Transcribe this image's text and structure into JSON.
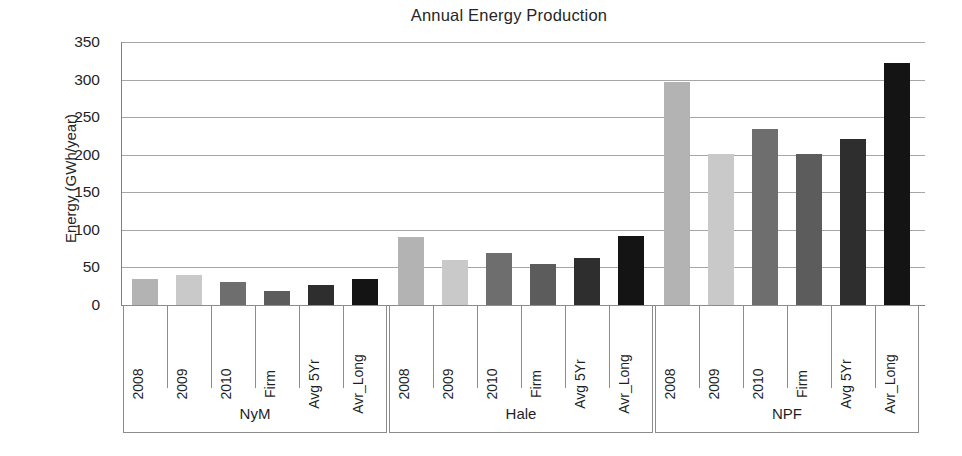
{
  "chart_data": {
    "type": "bar",
    "title": "Annual Energy Production",
    "xlabel": "",
    "ylabel": "Energy (GWh/year)",
    "ylim": [
      0,
      350
    ],
    "ytick_step": 50,
    "yticks": [
      350,
      300,
      250,
      200,
      150,
      100,
      50,
      0
    ],
    "grid": true,
    "legend": "none",
    "categories": [
      "2008",
      "2009",
      "2010",
      "Firm",
      "Avg 5Yr",
      "Avr_Long"
    ],
    "groups": [
      "NyM",
      "Hale",
      "NPF"
    ],
    "bar_colors": [
      "#b3b3b3",
      "#c9c9c9",
      "#6e6e6e",
      "#5c5c5c",
      "#2e2e2e",
      "#141414"
    ],
    "series": [
      {
        "name": "NyM",
        "values": [
          35,
          40,
          31,
          19,
          26,
          35
        ]
      },
      {
        "name": "Hale",
        "values": [
          90,
          60,
          69,
          54,
          62,
          92
        ]
      },
      {
        "name": "NPF",
        "values": [
          297,
          201,
          234,
          201,
          221,
          322
        ]
      }
    ]
  },
  "axis": {
    "y_title": "Energy (GWh/year)",
    "y_labels": [
      "350",
      "300",
      "250",
      "200",
      "150",
      "100",
      "50",
      "0"
    ]
  },
  "groups": [
    {
      "label": "NyM",
      "cats": [
        "2008",
        "2009",
        "2010",
        "Firm",
        "Avg 5Yr",
        "Avr_Long"
      ]
    },
    {
      "label": "Hale",
      "cats": [
        "2008",
        "2009",
        "2010",
        "Firm",
        "Avg 5Yr",
        "Avr_Long"
      ]
    },
    {
      "label": "NPF",
      "cats": [
        "2008",
        "2009",
        "2010",
        "Firm",
        "Avg 5Yr",
        "Avr_Long"
      ]
    }
  ]
}
